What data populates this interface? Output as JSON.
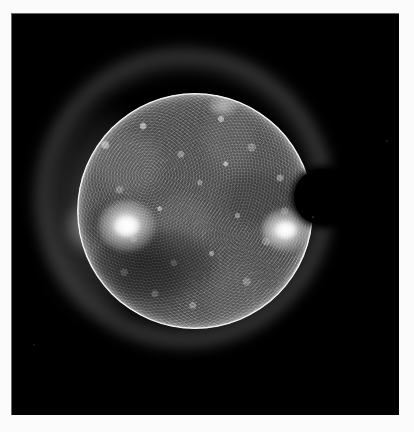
{
  "figure": {
    "kind": "solar-euv-image",
    "canvas_width": 414,
    "canvas_height": 432,
    "background_color": "#fbfbfb",
    "panel": {
      "label": "solar image panel",
      "x": 11,
      "y": 13,
      "width": 388,
      "height": 402,
      "background_color": "#000000",
      "border_color": "#bebebe"
    }
  },
  "scene": {
    "colors": {
      "space": "#000000",
      "disk_mid_gray": "#6a6a6a",
      "limb_bright": "#f2f2f2",
      "active_region": "#ffffff",
      "coronal_hole": "#3a3a3a",
      "occulter": "#000000",
      "halo": "#e8e8e8"
    },
    "solar_disk": {
      "label": "solar disk",
      "center_x": 195,
      "center_y": 211,
      "radius": 118,
      "surface_tone": "#6a6a6a",
      "limb_tone": "#e8e8e8"
    },
    "corona_halo": {
      "label": "coronal halo",
      "center_x": 184,
      "center_y": 198,
      "outer_radius": 149,
      "tone": "#e8e8e8"
    },
    "occulting_disk": {
      "label": "occulting disk",
      "center_x": 322,
      "center_y": 197,
      "radius": 28,
      "tone": "#000000"
    },
    "features": [
      {
        "name": "western active region",
        "center_x": 127,
        "center_y": 226,
        "brightness": "very bright",
        "tone": "#ffffff"
      },
      {
        "name": "eastern active region",
        "center_x": 286,
        "center_y": 230,
        "brightness": "very bright",
        "tone": "#ffffff"
      },
      {
        "name": "northern bright point",
        "center_x": 223,
        "center_y": 106,
        "brightness": "faint",
        "tone": "#e6e6e6"
      },
      {
        "name": "south-west coronal hole",
        "center_x": 152,
        "center_y": 258,
        "brightness": "dark",
        "tone": "#3a3a3a"
      }
    ],
    "field_specks": [
      {
        "x": 33,
        "y": 344
      },
      {
        "x": 312,
        "y": 216
      },
      {
        "x": 386,
        "y": 140
      }
    ]
  }
}
